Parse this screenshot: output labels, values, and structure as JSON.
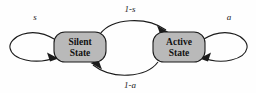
{
  "diagram": {
    "background_color": "#fefefe",
    "stroke_color": "#1b1b1b",
    "node_fill_color": "#b9b9b9",
    "nodes": [
      {
        "id": "silent",
        "label_line1": "Silent",
        "label_line2": "State"
      },
      {
        "id": "active",
        "label_line1": "Active",
        "label_line2": "State"
      }
    ],
    "edges": [
      {
        "id": "silent-self-loop",
        "label": "s",
        "from": "silent",
        "to": "silent"
      },
      {
        "id": "silent-to-active",
        "label": "1-s",
        "from": "silent",
        "to": "active"
      },
      {
        "id": "active-to-silent",
        "label": "1-a",
        "from": "active",
        "to": "silent"
      },
      {
        "id": "active-self-loop",
        "label": "a",
        "from": "active",
        "to": "active"
      }
    ]
  }
}
